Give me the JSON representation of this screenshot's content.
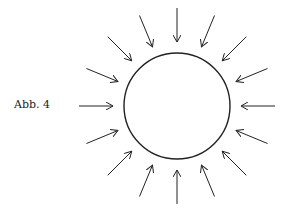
{
  "figure": {
    "label": "Abb. 4",
    "circle": {
      "cx": 177,
      "cy": 106,
      "r": 53
    },
    "arrows": {
      "count": 16,
      "inner_radius": 64,
      "outer_radius": 98,
      "direction": "inward"
    },
    "stroke_color": "#222222"
  }
}
